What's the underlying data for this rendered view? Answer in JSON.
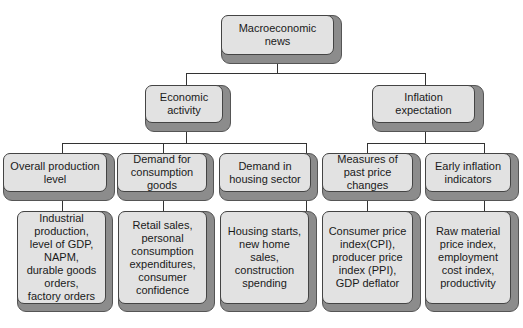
{
  "diagram": {
    "root": {
      "label": "Macroeconomic\nnews"
    },
    "branches": [
      {
        "label": "Economic\nactivity",
        "children": [
          {
            "label": "Overall production\nlevel",
            "detail": "Industrial\nproduction,\nlevel of GDP,\nNAPM,\ndurable goods\norders,\nfactory orders"
          },
          {
            "label": "Demand for\nconsumption\ngoods",
            "detail": "Retail sales,\npersonal\nconsumption\nexpenditures,\nconsumer\nconfidence"
          },
          {
            "label": "Demand in\nhousing sector",
            "detail": "Housing starts,\nnew home sales,\nconstruction\nspending"
          }
        ]
      },
      {
        "label": "Inflation\nexpectation",
        "children": [
          {
            "label": "Measures of\npast price\nchanges",
            "detail": "Consumer price\nindex(CPI),\nproducer price\nindex (PPI),\nGDP deflator"
          },
          {
            "label": "Early inflation\nindicators",
            "detail": "Raw material\nprice index,\nemployment\ncost index,\nproductivity"
          }
        ]
      }
    ]
  }
}
